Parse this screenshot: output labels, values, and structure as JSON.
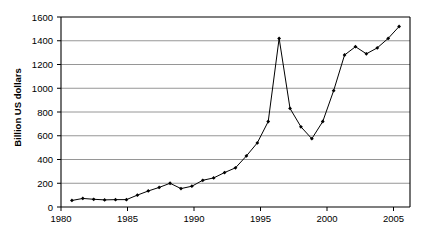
{
  "chart_data": {
    "type": "line",
    "title": "",
    "xlabel": "",
    "ylabel": "Billion US dollars",
    "xlim": [
      1980,
      2012
    ],
    "ylim": [
      0,
      1600
    ],
    "grid": true,
    "legend": false,
    "y_ticks": [
      0,
      200,
      400,
      600,
      800,
      1000,
      1200,
      1400,
      1600
    ],
    "x_ticks": [
      1980,
      1985,
      1990,
      1995,
      2000,
      2005,
      2010
    ],
    "marker": "filled-diamond",
    "line_color": "#000000",
    "marker_color": "#000000",
    "grid_color": "#808080",
    "axis_color": "#000000",
    "x": [
      1981,
      1982,
      1983,
      1984,
      1985,
      1986,
      1987,
      1988,
      1989,
      1990,
      1991,
      1992,
      1993,
      1994,
      1995,
      1996,
      1997,
      1998,
      1999,
      2000,
      2001,
      2002,
      2003,
      2004,
      2005,
      2006,
      2007,
      2008,
      2009,
      2010,
      2011
    ],
    "values": [
      55,
      72,
      65,
      60,
      62,
      62,
      100,
      135,
      165,
      200,
      155,
      175,
      225,
      245,
      290,
      330,
      430,
      540,
      720,
      1420,
      830,
      675,
      575,
      720,
      980,
      1280,
      1350,
      1290,
      1340,
      1420,
      1520
    ],
    "series": [
      {
        "name": "Billion US dollars",
        "values": [
          55,
          72,
          65,
          60,
          62,
          62,
          100,
          135,
          165,
          200,
          155,
          175,
          225,
          245,
          290,
          330,
          430,
          540,
          720,
          1420,
          830,
          675,
          575,
          720,
          980,
          1280,
          1350,
          1290,
          1340,
          1420,
          1520
        ]
      }
    ],
    "annotations": []
  },
  "axis": {
    "y_title": "Billion US dollars",
    "y_tick_labels": [
      "1600",
      "1400",
      "1200",
      "1000",
      "800",
      "600",
      "400",
      "200",
      "0"
    ],
    "x_tick_labels": [
      "1980",
      "1985",
      "1990",
      "1995",
      "2000",
      "2005",
      "2010"
    ]
  }
}
